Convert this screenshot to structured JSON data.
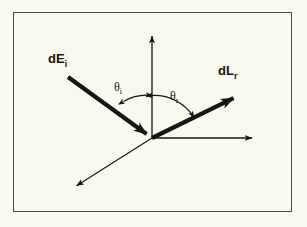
{
  "figure": {
    "type": "vector-diagram",
    "background_color": "#faf9ef",
    "border_color": "#4a4a3f",
    "ink_color": "#16160f"
  },
  "labels": {
    "incident_vector": {
      "base": "dE",
      "subscript": "i",
      "full": "dE_i"
    },
    "reflected_vector": {
      "base": "dL",
      "subscript": "r",
      "full": "dL_r"
    },
    "incident_angle": {
      "base": "θ",
      "subscript": "i",
      "full": "θ_i"
    },
    "reflected_angle": {
      "base": "θ",
      "subscript": "r",
      "full": "θ_r"
    }
  },
  "geometry": {
    "origin": {
      "x": 152,
      "y": 138
    },
    "axes": [
      {
        "name": "normal-axis",
        "from": [
          152,
          138
        ],
        "to": [
          152,
          33
        ],
        "arrow": "end",
        "weight": "thin"
      },
      {
        "name": "horizontal-axis",
        "from": [
          152,
          138
        ],
        "to": [
          255,
          138
        ],
        "arrow": "end",
        "weight": "thin"
      },
      {
        "name": "depth-axis",
        "from": [
          152,
          138
        ],
        "to": [
          73,
          188
        ],
        "arrow": "end",
        "weight": "thin"
      }
    ],
    "vectors": [
      {
        "name": "incident-irradiance",
        "from": [
          68,
          77
        ],
        "to": [
          152,
          138
        ],
        "arrow": "end",
        "weight": "bold"
      },
      {
        "name": "reflected-radiance",
        "from": [
          152,
          138
        ],
        "to": [
          240,
          95
        ],
        "arrow": "end",
        "weight": "bold"
      }
    ],
    "arcs": [
      {
        "name": "incident-angle-arc",
        "radius": 47,
        "start_deg": 125,
        "end_deg": 90,
        "arrow": "both"
      },
      {
        "name": "reflected-angle-arc",
        "radius": 47,
        "start_deg": 90,
        "end_deg": 26,
        "arrow": "both"
      }
    ],
    "label_positions": {
      "incident_vector": {
        "x": 48,
        "y": 63
      },
      "reflected_vector": {
        "x": 218,
        "y": 75
      },
      "incident_angle": {
        "x": 114,
        "y": 91
      },
      "reflected_angle": {
        "x": 170,
        "y": 100
      }
    }
  }
}
